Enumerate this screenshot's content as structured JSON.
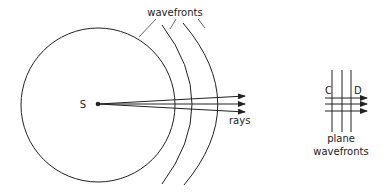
{
  "diagram": {
    "type": "wavefronts-and-rays",
    "labels": {
      "source": "S",
      "wavefronts": "wavefronts",
      "rays": "rays",
      "plane_line1": "plane",
      "plane_line2": "wavefronts",
      "point_c": "C",
      "point_d": "D"
    },
    "colors": {
      "stroke": "#222222",
      "background": "#ffffff"
    },
    "spherical": {
      "wavefront_count": 3,
      "ray_count": 3
    },
    "plane": {
      "wavefront_count": 3,
      "ray_count": 3
    }
  }
}
